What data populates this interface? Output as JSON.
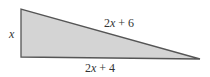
{
  "diagram": {
    "type": "right-triangle",
    "fill_color": "#d4d4d4",
    "stroke_color": "#555555",
    "vertices": {
      "top_left": [
        21,
        9
      ],
      "bottom_left": [
        21,
        57
      ],
      "right": [
        200,
        59
      ]
    },
    "labels": {
      "vertical_leg": "x",
      "hypotenuse": "2x + 6",
      "horizontal_leg": "2x + 4"
    }
  }
}
